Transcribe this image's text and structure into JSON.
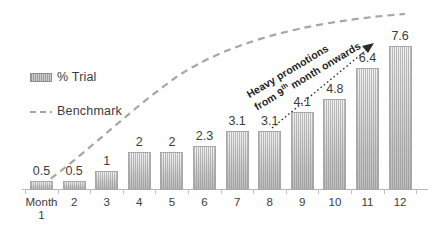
{
  "chart_data": {
    "type": "bar",
    "title": "",
    "subtitle": "",
    "xlabel": "",
    "ylabel": "",
    "ylim": [
      0,
      8
    ],
    "grid": false,
    "legend_position": "top-left",
    "categories": [
      "Month\n1",
      "2",
      "3",
      "4",
      "5",
      "6",
      "7",
      "8",
      "9",
      "10",
      "11",
      "12"
    ],
    "series": [
      {
        "name": "% Trial",
        "type": "bar",
        "values": [
          0.5,
          0.5,
          1,
          2,
          2,
          2.3,
          3.1,
          3.1,
          4.1,
          4.8,
          6.4,
          7.6
        ]
      },
      {
        "name": "Benchmark",
        "type": "line",
        "style": "dashed",
        "values": [
          0.6,
          2.2,
          3.6,
          4.8,
          5.7,
          6.4,
          6.9,
          7.3,
          7.6,
          7.85,
          8.0,
          8.1
        ]
      }
    ],
    "annotations": [
      {
        "text_line1": "Heavy promotions",
        "text_line2_pre": "from 9",
        "text_line2_sup": "th",
        "text_line2_post": " month onwards",
        "arrow": "dotted-arrow-to-month-12"
      }
    ]
  },
  "legend": {
    "items": [
      {
        "label": "% Trial",
        "marker": "hatched-bar-swatch"
      },
      {
        "label": "Benchmark",
        "marker": "dashed-line-swatch"
      }
    ]
  },
  "bars": [
    {
      "category": "Month",
      "category_sub": "1",
      "value": "0.5"
    },
    {
      "category": "2",
      "category_sub": "",
      "value": "0.5"
    },
    {
      "category": "3",
      "category_sub": "",
      "value": "1"
    },
    {
      "category": "4",
      "category_sub": "",
      "value": "2"
    },
    {
      "category": "5",
      "category_sub": "",
      "value": "2"
    },
    {
      "category": "6",
      "category_sub": "",
      "value": "2.3"
    },
    {
      "category": "7",
      "category_sub": "",
      "value": "3.1"
    },
    {
      "category": "8",
      "category_sub": "",
      "value": "3.1"
    },
    {
      "category": "9",
      "category_sub": "",
      "value": "4.1"
    },
    {
      "category": "10",
      "category_sub": "",
      "value": "4.8"
    },
    {
      "category": "11",
      "category_sub": "",
      "value": "6.4"
    },
    {
      "category": "12",
      "category_sub": "",
      "value": "7.6"
    }
  ],
  "annotation": {
    "line1": "Heavy promotions",
    "line2_pre": "from 9",
    "line2_sup": "th",
    "line2_post": " month onwards"
  },
  "colors": {
    "bar_fill_top": "#f2f2f2",
    "bar_fill_bottom": "#bdbdbd",
    "bar_border": "#a8a8a8",
    "benchmark_line": "#a6a6a6",
    "axis": "#b4b4b4",
    "text": "#3c3c3c",
    "annotation_text": "#1f1f1f",
    "background": "#ffffff"
  }
}
